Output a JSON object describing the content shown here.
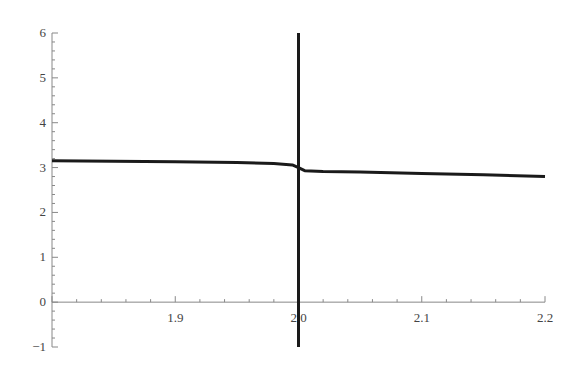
{
  "chart_data": {
    "type": "line",
    "title": "",
    "xlabel": "",
    "ylabel": "",
    "xlim": [
      1.8,
      2.2
    ],
    "ylim": [
      -1,
      6
    ],
    "grid": false,
    "legend": null,
    "x_ticks": [
      {
        "value": 1.9,
        "label": "1.9"
      },
      {
        "value": 2.0,
        "label": "2.0"
      },
      {
        "value": 2.1,
        "label": "2.1"
      },
      {
        "value": 2.2,
        "label": "2.2"
      }
    ],
    "y_ticks": [
      {
        "value": -1,
        "label": "−1"
      },
      {
        "value": 0,
        "label": "0"
      },
      {
        "value": 1,
        "label": "1"
      },
      {
        "value": 2,
        "label": "2"
      },
      {
        "value": 3,
        "label": "3"
      },
      {
        "value": 4,
        "label": "4"
      },
      {
        "value": 5,
        "label": "5"
      },
      {
        "value": 6,
        "label": "6"
      }
    ],
    "series": [
      {
        "name": "curve",
        "color": "#1a1a1a",
        "x": [
          1.8,
          1.85,
          1.9,
          1.95,
          1.98,
          1.995,
          2.0,
          2.005,
          2.02,
          2.05,
          2.1,
          2.15,
          2.2
        ],
        "y": [
          3.15,
          3.14,
          3.13,
          3.11,
          3.09,
          3.06,
          3.0,
          2.93,
          2.91,
          2.9,
          2.87,
          2.84,
          2.8
        ]
      },
      {
        "name": "vertical-asymptote",
        "color": "#1a1a1a",
        "x": [
          2.0,
          2.0
        ],
        "y": [
          6,
          -1
        ]
      }
    ]
  }
}
